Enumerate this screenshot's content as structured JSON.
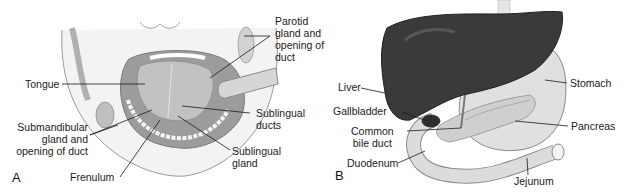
{
  "figure": {
    "panels": [
      {
        "id": "A",
        "letter": "A",
        "subject": "oral cavity - salivary glands",
        "labels": {
          "parotid": [
            "Parotid",
            "gland and",
            "opening of",
            "duct"
          ],
          "tongue": "Tongue",
          "sublingual_ducts": [
            "Sublingual",
            "ducts"
          ],
          "submandibular": [
            "Submandibular",
            "gland and",
            "opening of duct"
          ],
          "sublingual_gland": [
            "Sublingual",
            "gland"
          ],
          "frenulum": "Frenulum"
        }
      },
      {
        "id": "B",
        "letter": "B",
        "subject": "liver, stomach, pancreas and duodenum",
        "labels": {
          "liver": "Liver",
          "gallbladder": "Gallbladder",
          "common_bile_duct": [
            "Common",
            "bile duct"
          ],
          "duodenum": "Duodenum",
          "stomach": "Stomach",
          "pancreas": "Pancreas",
          "jejunum": "Jejunum"
        }
      }
    ],
    "colors": {
      "background": "#ffffff",
      "text": "#1a1a1a",
      "leader_line": "#1a1a1a",
      "liver": "#3a3a3a",
      "organ_light": "#d9d9d9",
      "skin": "#ececec",
      "mouth_dark": "#8a8a8a"
    }
  }
}
